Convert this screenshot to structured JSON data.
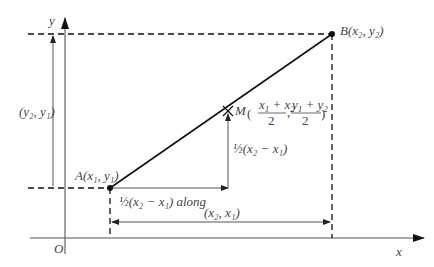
{
  "diagram": {
    "axes": {
      "x_label": "x",
      "y_label": "y",
      "origin_label": "O"
    },
    "points": {
      "A": {
        "name": "A",
        "coords": "(x1, y1)",
        "label": "A(x₁, y₁)"
      },
      "B": {
        "name": "B",
        "coords": "(x2, y2)",
        "label": "B(x₂, y₂)"
      },
      "M": {
        "name": "M",
        "coords": "((x1 + x2)/2, (y1 + y2)/2)",
        "label": "M((x₁ + x₂)/2, (y₁ + y₂)/2)"
      }
    },
    "annotations": {
      "vertical_extent": "(y₂, y₁)",
      "horizontal_extent": "(x₂, x₁)",
      "half_along": "½(x₂ − x₁) along",
      "half_up": "½(x₂ − x₁)"
    },
    "colors": {
      "line": "#111111",
      "axis": "#555555",
      "text": "#444444"
    }
  }
}
